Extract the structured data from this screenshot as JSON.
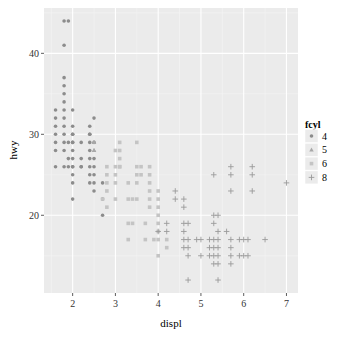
{
  "chart_data": {
    "type": "scatter",
    "title": "",
    "xlabel": "displ",
    "ylabel": "hwy",
    "xlim": [
      1.33,
      7.27
    ],
    "ylim": [
      10.4,
      45.6
    ],
    "x_ticks": [
      2,
      3,
      4,
      5,
      6,
      7
    ],
    "y_ticks": [
      20,
      30,
      40
    ],
    "grid": true,
    "legend": {
      "title": "fcyl",
      "position": "right",
      "entries": [
        {
          "label": "4",
          "shape": "circle",
          "color": "#8c8c8c"
        },
        {
          "label": "5",
          "shape": "triangle",
          "color": "#a8a8a8"
        },
        {
          "label": "6",
          "shape": "square",
          "color": "#c4c4c4"
        },
        {
          "label": "8",
          "shape": "plus",
          "color": "#9a9a9a"
        }
      ]
    },
    "series": [
      {
        "name": "4",
        "shape": "circle",
        "color": "#8c8c8c",
        "points": [
          [
            1.8,
            44
          ],
          [
            1.8,
            41
          ],
          [
            1.9,
            44
          ],
          [
            1.8,
            37
          ],
          [
            1.8,
            36
          ],
          [
            1.8,
            35
          ],
          [
            1.8,
            34
          ],
          [
            1.8,
            33
          ],
          [
            1.6,
            33
          ],
          [
            1.6,
            32
          ],
          [
            1.8,
            32
          ],
          [
            1.6,
            31
          ],
          [
            1.8,
            31
          ],
          [
            1.6,
            30
          ],
          [
            1.8,
            30
          ],
          [
            1.6,
            29
          ],
          [
            1.8,
            29
          ],
          [
            1.9,
            29
          ],
          [
            1.8,
            28
          ],
          [
            1.6,
            28
          ],
          [
            2.0,
            29
          ],
          [
            2.0,
            31
          ],
          [
            2.0,
            30
          ],
          [
            2.0,
            28
          ],
          [
            2.0,
            27
          ],
          [
            2.0,
            26
          ],
          [
            2.0,
            25
          ],
          [
            2.0,
            24
          ],
          [
            2.0,
            29
          ],
          [
            2.0,
            30
          ],
          [
            2.2,
            29
          ],
          [
            2.2,
            27
          ],
          [
            2.2,
            26
          ],
          [
            2.4,
            31
          ],
          [
            2.4,
            30
          ],
          [
            2.4,
            29
          ],
          [
            2.4,
            28
          ],
          [
            2.4,
            27
          ],
          [
            2.4,
            26
          ],
          [
            2.4,
            25
          ],
          [
            2.4,
            24
          ],
          [
            2.5,
            29
          ],
          [
            2.5,
            27
          ],
          [
            2.5,
            26
          ],
          [
            2.5,
            25
          ],
          [
            2.5,
            24
          ],
          [
            2.5,
            23
          ],
          [
            2.5,
            32
          ],
          [
            2.7,
            24
          ],
          [
            2.7,
            22
          ],
          [
            2.7,
            20
          ],
          [
            1.9,
            26
          ],
          [
            1.9,
            27
          ],
          [
            1.6,
            26
          ],
          [
            2.0,
            26
          ],
          [
            2.0,
            22
          ],
          [
            2.4,
            30
          ],
          [
            2.0,
            33
          ],
          [
            1.8,
            26
          ],
          [
            2.2,
            26
          ]
        ]
      },
      {
        "name": "5",
        "shape": "triangle",
        "color": "#a8a8a8",
        "points": [
          [
            2.5,
            28
          ],
          [
            2.5,
            29
          ],
          [
            2.5,
            29
          ],
          [
            2.5,
            28
          ]
        ]
      },
      {
        "name": "6",
        "shape": "square",
        "color": "#c4c4c4",
        "points": [
          [
            2.8,
            26
          ],
          [
            2.8,
            25
          ],
          [
            2.8,
            24
          ],
          [
            3.0,
            26
          ],
          [
            3.1,
            27
          ],
          [
            3.1,
            26
          ],
          [
            3.0,
            25
          ],
          [
            3.0,
            24
          ],
          [
            2.8,
            23
          ],
          [
            3.0,
            22
          ],
          [
            3.1,
            26
          ],
          [
            3.3,
            24
          ],
          [
            3.3,
            22
          ],
          [
            3.3,
            19
          ],
          [
            3.3,
            17
          ],
          [
            3.4,
            22
          ],
          [
            3.4,
            19
          ],
          [
            3.5,
            26
          ],
          [
            3.5,
            25
          ],
          [
            3.5,
            24
          ],
          [
            3.5,
            22
          ],
          [
            3.6,
            26
          ],
          [
            3.6,
            25
          ],
          [
            3.7,
            19
          ],
          [
            3.7,
            17
          ],
          [
            3.8,
            26
          ],
          [
            3.8,
            25
          ],
          [
            3.8,
            24
          ],
          [
            3.8,
            23
          ],
          [
            3.8,
            22
          ],
          [
            3.8,
            21
          ],
          [
            3.9,
            17
          ],
          [
            4.0,
            23
          ],
          [
            4.0,
            22
          ],
          [
            4.0,
            20
          ],
          [
            4.0,
            19
          ],
          [
            4.0,
            18
          ],
          [
            4.0,
            17
          ],
          [
            4.0,
            15
          ],
          [
            4.2,
            17
          ],
          [
            4.2,
            16
          ],
          [
            2.7,
            22
          ],
          [
            2.8,
            21
          ],
          [
            3.1,
            28
          ],
          [
            3.1,
            29
          ],
          [
            3.0,
            28
          ],
          [
            4.0,
            21
          ],
          [
            3.5,
            29
          ]
        ]
      },
      {
        "name": "8",
        "shape": "plus",
        "color": "#9a9a9a",
        "points": [
          [
            4.2,
            18
          ],
          [
            4.4,
            23
          ],
          [
            4.4,
            22
          ],
          [
            4.6,
            22
          ],
          [
            4.6,
            21
          ],
          [
            4.6,
            19
          ],
          [
            4.6,
            18
          ],
          [
            4.6,
            17
          ],
          [
            4.6,
            16
          ],
          [
            4.7,
            19
          ],
          [
            4.7,
            17
          ],
          [
            4.7,
            16
          ],
          [
            4.7,
            15
          ],
          [
            4.7,
            12
          ],
          [
            4.9,
            17
          ],
          [
            5.2,
            17
          ],
          [
            5.2,
            16
          ],
          [
            5.2,
            15
          ],
          [
            5.3,
            20
          ],
          [
            5.3,
            19
          ],
          [
            5.3,
            17
          ],
          [
            5.3,
            16
          ],
          [
            5.3,
            15
          ],
          [
            5.3,
            14
          ],
          [
            5.4,
            20
          ],
          [
            5.4,
            18
          ],
          [
            5.4,
            17
          ],
          [
            5.4,
            16
          ],
          [
            5.4,
            15
          ],
          [
            5.4,
            14
          ],
          [
            5.4,
            12
          ],
          [
            5.6,
            18
          ],
          [
            5.7,
            26
          ],
          [
            5.7,
            25
          ],
          [
            5.7,
            23
          ],
          [
            5.7,
            17
          ],
          [
            5.7,
            16
          ],
          [
            5.7,
            15
          ],
          [
            5.9,
            17
          ],
          [
            5.9,
            15
          ],
          [
            6.0,
            17
          ],
          [
            6.1,
            17
          ],
          [
            6.2,
            26
          ],
          [
            6.2,
            25
          ],
          [
            6.1,
            15
          ],
          [
            6.5,
            17
          ],
          [
            5.0,
            17
          ],
          [
            5.0,
            15
          ],
          [
            4.0,
            18
          ],
          [
            4.2,
            19
          ],
          [
            5.3,
            25
          ],
          [
            6.2,
            23
          ],
          [
            6.0,
            15
          ],
          [
            5.7,
            14
          ],
          [
            7.0,
            24
          ]
        ]
      }
    ]
  }
}
